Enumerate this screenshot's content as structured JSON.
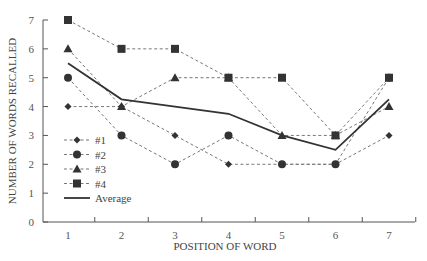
{
  "chart_data": {
    "type": "line",
    "title": "",
    "xlabel": "POSITION OF WORD",
    "ylabel": "NUMBER OF WORDS RECALLED",
    "x": [
      1,
      2,
      3,
      4,
      5,
      6,
      7
    ],
    "categories": [
      "1",
      "2",
      "3",
      "4",
      "5",
      "6",
      "7"
    ],
    "yticks": [
      "0",
      "1",
      "2",
      "3",
      "4",
      "5",
      "6",
      "7"
    ],
    "ylim": [
      0,
      7
    ],
    "grid": false,
    "legend_position": "lower-left inside",
    "series": [
      {
        "name": "#1",
        "marker": "diamond",
        "style": "dotted",
        "values": [
          4,
          4,
          3,
          2,
          2,
          2,
          3
        ]
      },
      {
        "name": "#2",
        "marker": "circle",
        "style": "dotted",
        "values": [
          5,
          3,
          2,
          3,
          2,
          2,
          5
        ]
      },
      {
        "name": "#3",
        "marker": "triangle",
        "style": "dotted",
        "values": [
          6,
          4,
          5,
          5,
          3,
          3,
          4
        ]
      },
      {
        "name": "#4",
        "marker": "square",
        "style": "dotted",
        "values": [
          7,
          6,
          6,
          5,
          5,
          3,
          5
        ]
      },
      {
        "name": "Average",
        "marker": "none",
        "style": "solid",
        "values": [
          5.5,
          4.25,
          4.0,
          3.75,
          3.0,
          2.5,
          4.25
        ]
      }
    ],
    "colors": {
      "series": "#333333",
      "dotted": "#777777",
      "axis": "#555555"
    }
  }
}
